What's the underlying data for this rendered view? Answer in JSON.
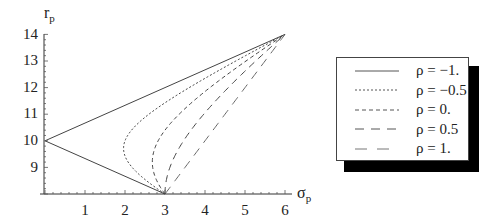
{
  "chart_data": {
    "type": "line",
    "title": "",
    "xlabel": "σ_p",
    "ylabel": "r_p",
    "xlim": [
      0,
      6
    ],
    "ylim": [
      8,
      14
    ],
    "xticks": [
      1,
      2,
      3,
      4,
      5,
      6
    ],
    "yticks": [
      9,
      10,
      11,
      12,
      13,
      14
    ],
    "grid": false,
    "legend_position": "right",
    "assets": {
      "A": {
        "sigma": 3,
        "r": 8
      },
      "B": {
        "sigma": 6,
        "r": 14
      }
    },
    "series": [
      {
        "name": "ρ = -1.",
        "rho": -1,
        "dash": "",
        "points": [
          [
            3,
            8
          ],
          [
            2.1,
            8.6
          ],
          [
            1.2,
            9.2
          ],
          [
            0.3,
            9.8
          ],
          [
            0,
            10
          ],
          [
            0.6,
            10.4
          ],
          [
            1.5,
            11
          ],
          [
            2.4,
            11.6
          ],
          [
            3.3,
            12.2
          ],
          [
            4.2,
            12.8
          ],
          [
            5.1,
            13.4
          ],
          [
            6,
            14
          ]
        ]
      },
      {
        "name": "ρ = -0.5",
        "rho": -0.5,
        "dash": "2,2",
        "points": [
          [
            3,
            8
          ],
          [
            2.51,
            8.6
          ],
          [
            2.15,
            9.2
          ],
          [
            1.98,
            9.8
          ],
          [
            2.06,
            10.4
          ],
          [
            2.51,
            11
          ],
          [
            3.12,
            11.6
          ],
          [
            3.8,
            12.2
          ],
          [
            4.51,
            12.8
          ],
          [
            5.25,
            13.4
          ],
          [
            6,
            14
          ]
        ]
      },
      {
        "name": "ρ = 0.",
        "rho": 0,
        "dash": "4,3",
        "points": [
          [
            3,
            8
          ],
          [
            2.77,
            8.6
          ],
          [
            2.68,
            9.2
          ],
          [
            2.74,
            9.8
          ],
          [
            3,
            10.4
          ],
          [
            3.35,
            11
          ],
          [
            3.8,
            11.6
          ],
          [
            4.33,
            12.2
          ],
          [
            4.9,
            12.8
          ],
          [
            5.44,
            13.4
          ],
          [
            6,
            14
          ]
        ]
      },
      {
        "name": "ρ = 0.5",
        "rho": 0.5,
        "dash": "7,5",
        "points": [
          [
            3,
            8
          ],
          [
            3.01,
            8.6
          ],
          [
            3.13,
            9.2
          ],
          [
            3.33,
            9.8
          ],
          [
            3.62,
            10.4
          ],
          [
            3.97,
            11
          ],
          [
            4.36,
            11.6
          ],
          [
            4.79,
            12.2
          ],
          [
            5.24,
            12.8
          ],
          [
            5.62,
            13.4
          ],
          [
            6,
            14
          ]
        ]
      },
      {
        "name": "ρ = 1.",
        "rho": 1,
        "dash": "9,7",
        "points": [
          [
            3,
            8
          ],
          [
            3.3,
            8.6
          ],
          [
            3.6,
            9.2
          ],
          [
            3.9,
            9.8
          ],
          [
            4.2,
            10.4
          ],
          [
            4.5,
            11
          ],
          [
            4.8,
            11.6
          ],
          [
            5.1,
            12.2
          ],
          [
            5.4,
            12.8
          ],
          [
            5.7,
            13.4
          ],
          [
            6,
            14
          ]
        ]
      }
    ]
  },
  "axes": {
    "x_label_main": "σ",
    "x_label_sub": "p",
    "y_label_main": "r",
    "y_label_sub": "p",
    "x_ticks": [
      "1",
      "2",
      "3",
      "4",
      "5",
      "6"
    ],
    "y_ticks": [
      "9",
      "10",
      "11",
      "12",
      "13",
      "14"
    ]
  },
  "legend": {
    "items": [
      {
        "label": "ρ = −1."
      },
      {
        "label": "ρ = −0.5"
      },
      {
        "label": "ρ = 0."
      },
      {
        "label": "ρ = 0.5"
      },
      {
        "label": "ρ = 1."
      }
    ]
  }
}
